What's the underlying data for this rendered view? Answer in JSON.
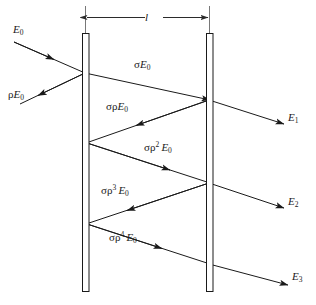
{
  "figure": {
    "type": "optics-ray-diagram",
    "background_color": "#ffffff",
    "line_color": "#1a1a1a"
  },
  "dimension": {
    "label": "l",
    "meaning": "plate separation thickness",
    "x_start": 85,
    "x_end": 209,
    "y": 17
  },
  "plates": [
    {
      "name": "left-plate",
      "x": 82,
      "y": 33,
      "width": 7,
      "height": 259
    },
    {
      "name": "right-plate",
      "x": 206,
      "y": 33,
      "width": 7,
      "height": 259
    }
  ],
  "labels": {
    "incident": {
      "sigma": "",
      "base": "E",
      "sub": "0",
      "text": "E0",
      "x": 13,
      "y": 31
    },
    "reflected": {
      "prefix": "ρ",
      "base": "E",
      "sub": "0",
      "text": "ρE0",
      "x": 8,
      "y": 96
    },
    "transmitted_1": {
      "prefix": "σ",
      "base": "E",
      "sub": "0",
      "text": "σE0",
      "x": 135,
      "y": 66
    },
    "internal_1": {
      "prefix": "σρ",
      "base": "E",
      "sub": "0",
      "text": "σρE0",
      "x": 107,
      "y": 108
    },
    "internal_2": {
      "prefix": "σρ",
      "sup": "2",
      "base": "E",
      "sub": "0",
      "text": "σρ²E0",
      "x": 145,
      "y": 149
    },
    "internal_3": {
      "prefix": "σρ",
      "sup": "3",
      "base": "E",
      "sub": "0",
      "text": "σρ³E0",
      "x": 102,
      "y": 192
    },
    "internal_4": {
      "prefix": "σρ",
      "sup": "4",
      "base": "E",
      "sub": "0",
      "text": "σρ⁴E0",
      "x": 110,
      "y": 239
    },
    "output_1": {
      "base": "E",
      "sub": "1",
      "text": "E1",
      "x": 286,
      "y": 118
    },
    "output_2": {
      "base": "E",
      "sub": "2",
      "text": "E2",
      "x": 286,
      "y": 202
    },
    "output_3": {
      "base": "E",
      "sub": "3",
      "text": "E3",
      "x": 290,
      "y": 277
    }
  },
  "rays": [
    {
      "name": "incident-ray",
      "from": [
        14,
        42
      ],
      "to": [
        85,
        73
      ],
      "arrow_at": 0.62
    },
    {
      "name": "reflected-ray",
      "from": [
        85,
        73
      ],
      "to": [
        20,
        104
      ],
      "arrow_at": 0.72
    },
    {
      "name": "transmitted-ray-1",
      "from": [
        85,
        73
      ],
      "to": [
        209,
        100
      ],
      "arrow_at": 1.0
    },
    {
      "name": "internal-ray-1",
      "from": [
        209,
        100
      ],
      "to": [
        88,
        143
      ],
      "arrow_at": 0.66
    },
    {
      "name": "internal-ray-2",
      "from": [
        88,
        143
      ],
      "to": [
        209,
        183
      ],
      "arrow_at": 0.68
    },
    {
      "name": "internal-ray-3",
      "from": [
        209,
        183
      ],
      "to": [
        88,
        224
      ],
      "arrow_at": 0.68
    },
    {
      "name": "internal-ray-4",
      "from": [
        88,
        224
      ],
      "to": [
        209,
        264
      ],
      "arrow_at": 0.62
    },
    {
      "name": "output-ray-1",
      "from": [
        209,
        100
      ],
      "to": [
        283,
        124
      ],
      "arrow_at": 1.0
    },
    {
      "name": "output-ray-2",
      "from": [
        209,
        183
      ],
      "to": [
        283,
        208
      ],
      "arrow_at": 1.0
    },
    {
      "name": "output-ray-3",
      "from": [
        209,
        264
      ],
      "to": [
        287,
        284
      ],
      "arrow_at": 1.0
    }
  ]
}
